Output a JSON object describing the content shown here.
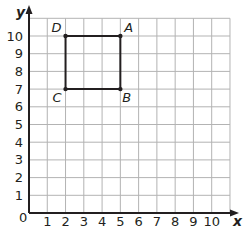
{
  "axes": {
    "x_label": "x",
    "y_label": "y",
    "origin_label": "0",
    "x_ticks": [
      "1",
      "2",
      "3",
      "4",
      "5",
      "6",
      "7",
      "8",
      "9",
      "10"
    ],
    "y_ticks": [
      "1",
      "2",
      "3",
      "4",
      "5",
      "6",
      "7",
      "8",
      "9",
      "10"
    ],
    "x_range": [
      0,
      11
    ],
    "y_range": [
      0,
      11
    ]
  },
  "points": [
    {
      "label": "A",
      "x": 5,
      "y": 10
    },
    {
      "label": "B",
      "x": 5,
      "y": 7
    },
    {
      "label": "C",
      "x": 2,
      "y": 7
    },
    {
      "label": "D",
      "x": 2,
      "y": 10
    }
  ],
  "shape": {
    "type": "square",
    "vertices": [
      "A",
      "B",
      "C",
      "D"
    ]
  },
  "colors": {
    "grid": "#b3b3b3",
    "axis": "#231f20",
    "shape": "#231f20"
  }
}
